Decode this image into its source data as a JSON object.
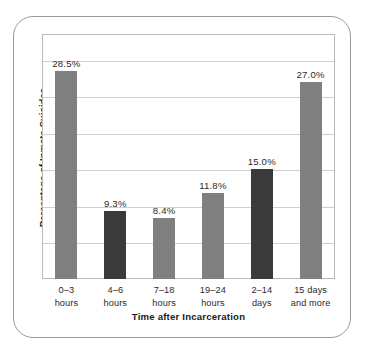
{
  "chart_data": {
    "type": "bar",
    "title": "",
    "xlabel": "Time after Incarceration",
    "ylabel": "Percentage of Inmate Suicides",
    "categories": [
      "0–3\nhours",
      "4–6\nhours",
      "7–18\nhours",
      "19–24\nhours",
      "2–14\ndays",
      "15 days\nand more"
    ],
    "values": [
      28.5,
      9.3,
      8.4,
      11.8,
      15.0,
      27.0
    ],
    "value_labels": [
      "28.5%",
      "9.3%",
      "8.4%",
      "11.8%",
      "15.0%",
      "27.0%"
    ],
    "bar_colors": [
      "#808080",
      "#3a3a3a",
      "#808080",
      "#808080",
      "#3a3a3a",
      "#808080"
    ],
    "ylim": [
      0,
      33.5
    ],
    "gridlines": [
      5,
      10,
      15,
      20,
      25,
      30
    ],
    "grid": true,
    "legend": "none",
    "colors": {
      "bar_gray": "#808080",
      "bar_dark": "#3a3a3a",
      "gridline": "#cfcfcf",
      "plot_border": "#b9b9b9",
      "frame_border": "#9b9b9b",
      "text": "#2a2a2a",
      "background": "#ffffff"
    }
  }
}
